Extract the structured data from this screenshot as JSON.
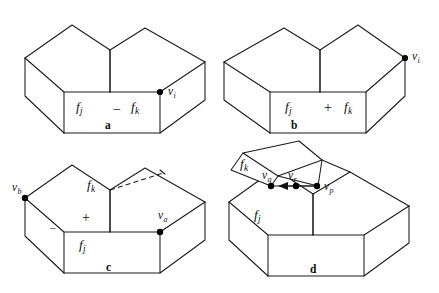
{
  "figure": {
    "background_color": "#ffffff",
    "ink_color": "#1a1a1a",
    "panels": [
      {
        "id": "a",
        "letter": "a",
        "face_labels": [
          "f_j",
          "f_k"
        ],
        "sign": "−",
        "sign_name": "minus",
        "vertex_labels": [
          "v_i"
        ],
        "description": "L-shaped block, notch at top, vertex v_i on right front edge"
      },
      {
        "id": "b",
        "letter": "b",
        "face_labels": [
          "f_j",
          "f_k"
        ],
        "sign": "+",
        "sign_name": "plus",
        "vertex_labels": [
          "v_i"
        ],
        "description": "Mirrored L-shaped block, vertex v_i at far right top corner"
      },
      {
        "id": "c",
        "letter": "c",
        "face_labels": [
          "f_k",
          "f_j"
        ],
        "signs": [
          "+",
          "−"
        ],
        "vertex_labels": [
          "v_b",
          "v_a"
        ],
        "dashed_edge": true,
        "description": "L-shaped block with dashed split line and two marked vertices"
      },
      {
        "id": "d",
        "letter": "d",
        "face_labels": [
          "f_k",
          "f_j"
        ],
        "vertex_labels": [
          "v_q",
          "v_r",
          "v_p"
        ],
        "detached_piece": true,
        "arrow": "leftward",
        "description": "L-shaped block with detached wedge f_k lifted above, arrow from v_p to v_q"
      }
    ],
    "letters": {
      "a": "a",
      "b": "b",
      "c": "c",
      "d": "d"
    },
    "symbols": {
      "minus": "−",
      "plus": "+",
      "minus_small": "–"
    },
    "glyphs": {
      "f": "f",
      "v": "v",
      "sub_i": "i",
      "sub_j": "j",
      "sub_k": "k",
      "sub_a": "a",
      "sub_b": "b",
      "sub_p": "p",
      "sub_q": "q",
      "sub_r": "r"
    }
  }
}
